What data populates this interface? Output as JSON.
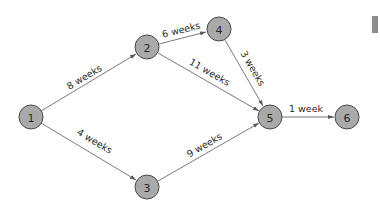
{
  "diagram": {
    "type": "network-activity-diagram",
    "nodes": [
      {
        "id": "1",
        "label": "1",
        "x": 31,
        "y": 117
      },
      {
        "id": "2",
        "label": "2",
        "x": 147,
        "y": 47
      },
      {
        "id": "3",
        "label": "3",
        "x": 147,
        "y": 187
      },
      {
        "id": "4",
        "label": "4",
        "x": 219,
        "y": 29
      },
      {
        "id": "5",
        "label": "5",
        "x": 270,
        "y": 117
      },
      {
        "id": "6",
        "label": "6",
        "x": 347,
        "y": 117
      }
    ],
    "edges": [
      {
        "from": "1",
        "to": "2",
        "label": "8 weeks"
      },
      {
        "from": "1",
        "to": "3",
        "label": "4 weeks"
      },
      {
        "from": "2",
        "to": "4",
        "label": "6 weeks"
      },
      {
        "from": "2",
        "to": "5",
        "label": "11 weeks"
      },
      {
        "from": "4",
        "to": "5",
        "label": "3 weeks"
      },
      {
        "from": "3",
        "to": "5",
        "label": "9 weeks"
      },
      {
        "from": "5",
        "to": "6",
        "label": "1 week"
      }
    ],
    "node_radius": 12,
    "colors": {
      "node_fill": "#a9a9a9",
      "node_stroke": "#4a4a4a",
      "edge": "#7a7a7a",
      "text": "#2a2a2a"
    }
  }
}
